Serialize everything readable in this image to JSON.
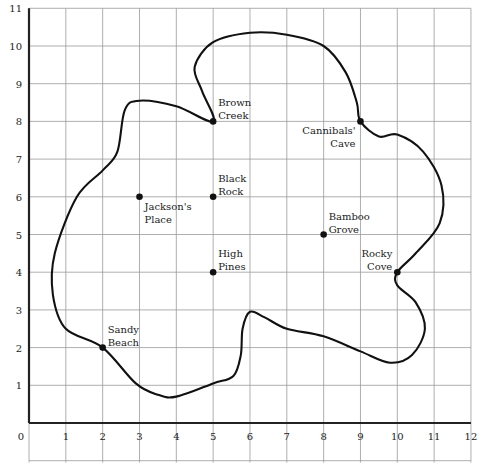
{
  "map": {
    "type": "island-treasure-grid-map",
    "grid": {
      "x_range": [
        0,
        12
      ],
      "y_range": [
        0,
        11
      ],
      "x_ticks": [
        "0",
        "1",
        "2",
        "3",
        "4",
        "5",
        "6",
        "7",
        "8",
        "9",
        "10",
        "11",
        "12"
      ],
      "y_ticks": [
        "1",
        "2",
        "3",
        "4",
        "5",
        "6",
        "7",
        "8",
        "9",
        "10",
        "11"
      ],
      "origin_label": "0"
    },
    "locations": [
      {
        "name": "Brown Creek",
        "lines": [
          "Brown",
          "Creek"
        ],
        "x": 5,
        "y": 8,
        "label_pos": "upper-right"
      },
      {
        "name": "Cannibals' Cave",
        "lines": [
          "Cannibals'",
          "Cave"
        ],
        "x": 9,
        "y": 8,
        "label_pos": "lower-left"
      },
      {
        "name": "Black Rock",
        "lines": [
          "Black",
          "Rock"
        ],
        "x": 5,
        "y": 6,
        "label_pos": "upper-right"
      },
      {
        "name": "Jackson's Place",
        "lines": [
          "Jackson's",
          "Place"
        ],
        "x": 3,
        "y": 6,
        "label_pos": "lower-right"
      },
      {
        "name": "Bamboo Grove",
        "lines": [
          "Bamboo",
          "Grove"
        ],
        "x": 8,
        "y": 5,
        "label_pos": "upper-right"
      },
      {
        "name": "High Pines",
        "lines": [
          "High",
          "Pines"
        ],
        "x": 5,
        "y": 4,
        "label_pos": "upper-right"
      },
      {
        "name": "Rocky Cove",
        "lines": [
          "Rocky",
          "Cove"
        ],
        "x": 10,
        "y": 4,
        "label_pos": "upper-left"
      },
      {
        "name": "Sandy Beach",
        "lines": [
          "Sandy",
          "Beach"
        ],
        "x": 2,
        "y": 2,
        "label_pos": "upper-right"
      }
    ],
    "coastline": [
      [
        2,
        2
      ],
      [
        1.0,
        2.5
      ],
      [
        0.65,
        3.4
      ],
      [
        0.7,
        4.5
      ],
      [
        1.3,
        6.0
      ],
      [
        2.0,
        6.7
      ],
      [
        2.4,
        7.2
      ],
      [
        2.6,
        8.3
      ],
      [
        3.0,
        8.55
      ],
      [
        4.0,
        8.4
      ],
      [
        5,
        8
      ],
      [
        4.7,
        8.8
      ],
      [
        4.5,
        9.45
      ],
      [
        5.0,
        10.1
      ],
      [
        6.0,
        10.35
      ],
      [
        7.0,
        10.3
      ],
      [
        8.0,
        10.0
      ],
      [
        8.6,
        9.3
      ],
      [
        8.9,
        8.5
      ],
      [
        9,
        8
      ],
      [
        9.5,
        7.6
      ],
      [
        10.0,
        7.65
      ],
      [
        10.7,
        7.2
      ],
      [
        11.2,
        6.3
      ],
      [
        11.15,
        5.3
      ],
      [
        10.5,
        4.5
      ],
      [
        10,
        4
      ],
      [
        10.0,
        3.65
      ],
      [
        10.5,
        3.2
      ],
      [
        10.75,
        2.5
      ],
      [
        10.4,
        1.8
      ],
      [
        9.8,
        1.6
      ],
      [
        9.0,
        1.9
      ],
      [
        8.0,
        2.3
      ],
      [
        7.0,
        2.5
      ],
      [
        6.4,
        2.8
      ],
      [
        6.0,
        2.95
      ],
      [
        5.8,
        2.5
      ],
      [
        5.75,
        1.8
      ],
      [
        5.55,
        1.25
      ],
      [
        5.0,
        1.05
      ],
      [
        4.0,
        0.7
      ],
      [
        3.5,
        0.75
      ],
      [
        2.9,
        1.05
      ],
      [
        2,
        2
      ]
    ],
    "colors": {
      "coast": "#111111",
      "grid": "#9a9a9a",
      "axis": "#222222",
      "background": "#ffffff"
    }
  }
}
